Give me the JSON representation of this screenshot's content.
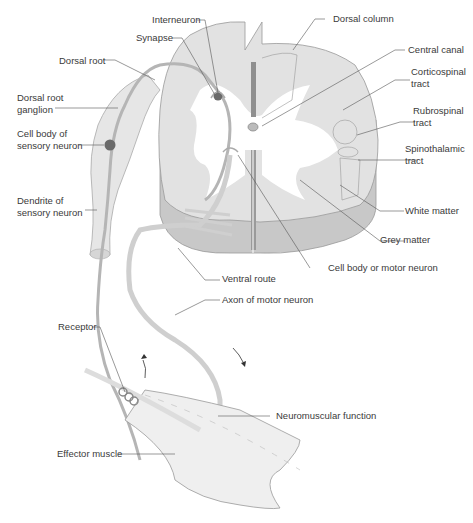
{
  "figure": {
    "type": "diagram",
    "colors": {
      "grey_matter_fill": "#e2e2e2",
      "white_matter_side": "#c8c8c8",
      "nerve_fill": "#d4d4d4",
      "nerve_stroke": "#9a9a9a",
      "cell_body": "#6a6a6a",
      "leader_line": "#555555",
      "label_text": "#3a3a3a",
      "muscle_fill": "#ececec"
    }
  },
  "labels": {
    "interneuron": "Interneuron",
    "synapse": "Synapse",
    "dorsal_root": "Dorsal root",
    "dorsal_root_ganglion": "Dorsal root\nganglion",
    "cell_body_sensory": "Cell body of\nsensory neuron",
    "dendrite_sensory": "Dendrite of\nsensory neuron",
    "dorsal_column": "Dorsal column",
    "central_canal": "Central canal",
    "corticospinal_tract": "Corticospinal\ntract",
    "rubrospinal_tract": "Rubrospinal\ntract",
    "spinothalamic_tract": "Spinothalamic\ntract",
    "white_matter": "White matter",
    "grey_matter": "Grey matter",
    "cell_body_motor": "Cell body or motor neuron",
    "ventral_route": "Ventral route",
    "axon_motor": "Axon of motor neuron",
    "receptor": "Receptor",
    "neuromuscular": "Neuromuscular function",
    "effector_muscle": "Effector muscle"
  }
}
